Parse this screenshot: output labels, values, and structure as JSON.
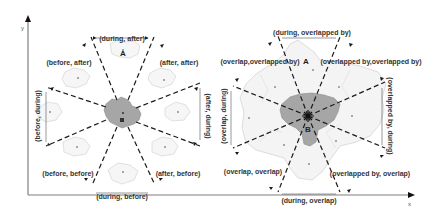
{
  "axes": {
    "x_label": "x",
    "y_label": "y"
  },
  "colors": {
    "region_b": "#a6a6a6",
    "region_a": "#f2f2f2",
    "region_a_stroke": "#d0d0d0",
    "lines": "#1a1a1a",
    "axis": "#7f7f7f"
  },
  "left_diagram": {
    "region_a_label": "A",
    "region_b_label": "B",
    "labels": {
      "top": "(during, after)",
      "top_left": "(before, after)",
      "top_right": "(after, after)",
      "left": "(before, during)",
      "right": "(after, during)",
      "bottom_left": "(before, before)",
      "bottom_right": "(after, before)",
      "bottom": "(during, before)"
    }
  },
  "right_diagram": {
    "region_a_label": "A",
    "region_b_label": "B",
    "labels": {
      "top": "(during, overlapped by)",
      "top_left": "(overlap,overlapped by)",
      "top_right": "(overlapped by,overlapped by)",
      "left": "(overlap, during)",
      "right": "(overlapped by, during)",
      "bottom_left": "(overlap, overlap)",
      "bottom_right": "(overlapped by, overlap)",
      "bottom": "(during, overlap)"
    }
  }
}
